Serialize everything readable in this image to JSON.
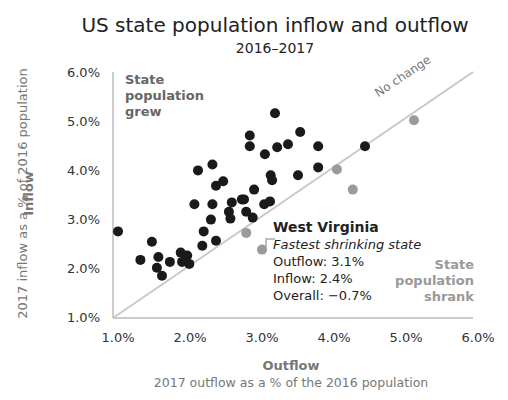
{
  "title": "US state population inflow and outflow",
  "subtitle": "2016–2017",
  "y_axis": {
    "title": "Inflow",
    "subtitle": "2017 inflow as a % of 2016 population",
    "ticks": [
      "6.0%",
      "5.0%",
      "4.0%",
      "3.0%",
      "2.0%",
      "1.0%"
    ]
  },
  "x_axis": {
    "title": "Outflow",
    "subtitle": "2017 outflow as a % of the 2016 population",
    "ticks": [
      "1.0%",
      "2.0%",
      "3.0%",
      "4.0%",
      "5.0%",
      "6.0%"
    ]
  },
  "regions": {
    "grew_line1": "State",
    "grew_line2": "population",
    "grew_line3": "grew",
    "shrank_line1": "State",
    "shrank_line2": "population",
    "shrank_line3": "shrank"
  },
  "reference_line_label": "No change",
  "annotation": {
    "state": "West Virginia",
    "tag": "Fastest shrinking state",
    "outflow": "Outflow: 3.1%",
    "inflow": "Inflow: 2.4%",
    "overall": "Overall: −0.7%"
  },
  "colors": {
    "grew": "#1a1a1a",
    "shrank": "#9a9a9a",
    "reference_line": "#c8c8c8",
    "axis": "#cccccc"
  },
  "chart_data": {
    "type": "scatter",
    "title": "US state population inflow and outflow",
    "subtitle": "2016–2017",
    "xlabel": "Outflow — 2017 outflow as a % of the 2016 population",
    "ylabel": "Inflow — 2017 inflow as a % of 2016 population",
    "xlim": [
      1.0,
      6.0
    ],
    "ylim": [
      1.0,
      6.0
    ],
    "x_ticks": [
      "1.0%",
      "2.0%",
      "3.0%",
      "4.0%",
      "5.0%",
      "6.0%"
    ],
    "y_ticks": [
      "1.0%",
      "2.0%",
      "3.0%",
      "4.0%",
      "5.0%",
      "6.0%"
    ],
    "grid": false,
    "reference_line": {
      "label": "No change",
      "from": [
        1.0,
        1.0
      ],
      "to": [
        6.0,
        6.0
      ]
    },
    "series": [
      {
        "name": "State population grew",
        "color": "#1a1a1a",
        "points": [
          [
            1.07,
            2.76
          ],
          [
            1.38,
            2.18
          ],
          [
            1.54,
            2.55
          ],
          [
            1.61,
            2.02
          ],
          [
            1.63,
            2.24
          ],
          [
            1.68,
            1.86
          ],
          [
            1.79,
            2.14
          ],
          [
            1.94,
            2.33
          ],
          [
            1.96,
            2.14
          ],
          [
            2.03,
            2.27
          ],
          [
            2.06,
            2.1
          ],
          [
            2.13,
            3.31
          ],
          [
            2.18,
            4.0
          ],
          [
            2.24,
            2.47
          ],
          [
            2.26,
            2.76
          ],
          [
            2.36,
            3.0
          ],
          [
            2.38,
            3.31
          ],
          [
            2.38,
            4.12
          ],
          [
            2.43,
            3.69
          ],
          [
            2.43,
            2.57
          ],
          [
            2.53,
            3.78
          ],
          [
            2.61,
            3.16
          ],
          [
            2.63,
            3.02
          ],
          [
            2.65,
            3.35
          ],
          [
            2.79,
            3.41
          ],
          [
            2.82,
            3.41
          ],
          [
            2.85,
            3.16
          ],
          [
            2.9,
            4.71
          ],
          [
            2.9,
            4.49
          ],
          [
            2.94,
            3.04
          ],
          [
            2.96,
            3.61
          ],
          [
            3.1,
            3.31
          ],
          [
            3.11,
            4.33
          ],
          [
            3.18,
            3.37
          ],
          [
            3.19,
            3.9
          ],
          [
            3.21,
            3.8
          ],
          [
            3.25,
            5.16
          ],
          [
            3.28,
            4.47
          ],
          [
            3.43,
            4.53
          ],
          [
            3.57,
            3.9
          ],
          [
            3.6,
            4.78
          ],
          [
            3.85,
            4.49
          ],
          [
            3.85,
            4.06
          ],
          [
            4.5,
            4.49
          ]
        ]
      },
      {
        "name": "State population shrank",
        "color": "#9a9a9a",
        "points": [
          [
            2.85,
            2.73
          ],
          [
            3.07,
            2.39
          ],
          [
            4.11,
            4.02
          ],
          [
            4.33,
            3.61
          ],
          [
            5.18,
            5.02
          ]
        ]
      }
    ],
    "annotations": [
      {
        "text": "West Virginia — Fastest shrinking state; Outflow: 3.1%; Inflow: 2.4%; Overall: −0.7%",
        "point": [
          3.1,
          2.4
        ]
      },
      {
        "text": "State population grew",
        "position": "upper-left"
      },
      {
        "text": "State population shrank",
        "position": "lower-right"
      },
      {
        "text": "No change",
        "position": "along diagonal, upper-right"
      }
    ]
  }
}
